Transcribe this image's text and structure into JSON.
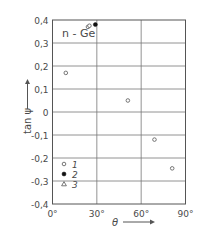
{
  "chart_data": {
    "type": "scatter",
    "title": "",
    "annotation": "n - Ge",
    "xlabel": "θ",
    "ylabel": "tan ψ",
    "xlim": [
      0,
      90
    ],
    "ylim": [
      -0.4,
      0.4
    ],
    "x_ticks": [
      0,
      30,
      60,
      90
    ],
    "x_tick_labels": [
      "0°",
      "30°",
      "60°",
      "90°"
    ],
    "y_ticks": [
      0.4,
      0.3,
      0.2,
      0.1,
      0,
      -0.1,
      -0.2,
      -0.3,
      -0.4
    ],
    "y_tick_labels": [
      "0,4",
      "0,3",
      "0,2",
      "0,1",
      "0",
      "-0,1",
      "-0,2",
      "-0,3",
      "-0,4"
    ],
    "grid": true,
    "legend_position": "lower-left-inside",
    "series": [
      {
        "name": "1",
        "marker": "open-circle",
        "points": [
          [
            9,
            0.17
          ],
          [
            24,
            0.37
          ],
          [
            25,
            0.375
          ],
          [
            51,
            0.05
          ],
          [
            69,
            -0.12
          ],
          [
            81,
            -0.245
          ]
        ]
      },
      {
        "name": "2",
        "marker": "filled-circle",
        "points": [
          [
            29,
            0.38
          ]
        ]
      },
      {
        "name": "3",
        "marker": "open-triangle",
        "points": []
      }
    ]
  },
  "legend": {
    "items": [
      {
        "marker": "open-circle",
        "label": "1"
      },
      {
        "marker": "filled-circle",
        "label": "2"
      },
      {
        "marker": "open-triangle",
        "label": "3"
      }
    ]
  },
  "labels": {
    "annotation": "n - Ge",
    "xlabel": "θ",
    "ylabel": "tan ψ"
  },
  "colors": {
    "axis": "#555555",
    "grid": "#777777",
    "marker": "#555555",
    "text": "#4a4a4a"
  }
}
